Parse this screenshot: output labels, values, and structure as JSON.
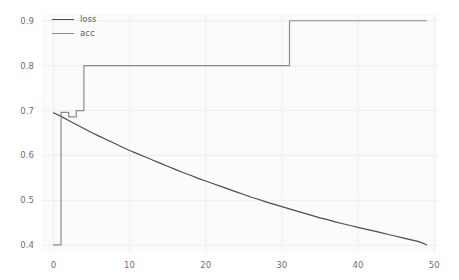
{
  "figure": {
    "width": 459,
    "height": 280,
    "background_color": "#ffffff",
    "axes_background_color": "#fbfbfb",
    "grid_color": "#ededf2"
  },
  "legend": {
    "position": "upper-left",
    "entries": [
      {
        "label": "loss",
        "color": "#4d4d4d",
        "icon": "line-swatch-icon"
      },
      {
        "label": "acc",
        "color": "#8a8a8a",
        "icon": "line-swatch-icon"
      }
    ]
  },
  "axes": {
    "y_ticks": [
      "0.9",
      "0.8",
      "0.7",
      "0.6",
      "0.5",
      "0.4"
    ],
    "x_ticks": [
      "0",
      "10",
      "20",
      "30",
      "40",
      "50"
    ]
  },
  "chart_data": {
    "type": "line",
    "title": "",
    "subtitle": "",
    "xlabel": "",
    "ylabel": "",
    "xlim": [
      -1.5,
      50.5
    ],
    "ylim": [
      0.385,
      0.915
    ],
    "grid": true,
    "legend_position": "upper left",
    "x": [
      0,
      1,
      2,
      3,
      4,
      5,
      6,
      7,
      8,
      9,
      10,
      11,
      12,
      13,
      14,
      15,
      16,
      17,
      18,
      19,
      20,
      21,
      22,
      23,
      24,
      25,
      26,
      27,
      28,
      29,
      30,
      31,
      32,
      33,
      34,
      35,
      36,
      37,
      38,
      39,
      40,
      41,
      42,
      43,
      44,
      45,
      46,
      47,
      48,
      49
    ],
    "series": [
      {
        "name": "loss",
        "color": "#4d4d4d",
        "drawstyle": "default",
        "values": [
          0.695,
          0.687,
          0.678,
          0.669,
          0.66,
          0.651,
          0.643,
          0.635,
          0.627,
          0.619,
          0.611,
          0.604,
          0.597,
          0.59,
          0.583,
          0.576,
          0.569,
          0.562,
          0.556,
          0.549,
          0.543,
          0.537,
          0.531,
          0.525,
          0.519,
          0.513,
          0.507,
          0.502,
          0.496,
          0.491,
          0.486,
          0.481,
          0.476,
          0.471,
          0.466,
          0.461,
          0.457,
          0.452,
          0.448,
          0.444,
          0.44,
          0.436,
          0.432,
          0.428,
          0.424,
          0.42,
          0.416,
          0.412,
          0.408,
          0.401
        ]
      },
      {
        "name": "acc",
        "color": "#8a8a8a",
        "drawstyle": "steps-post",
        "values": [
          0.401,
          0.696,
          0.686,
          0.7,
          0.8,
          0.8,
          0.8,
          0.8,
          0.8,
          0.8,
          0.8,
          0.8,
          0.8,
          0.8,
          0.8,
          0.8,
          0.8,
          0.8,
          0.8,
          0.8,
          0.8,
          0.8,
          0.8,
          0.8,
          0.8,
          0.8,
          0.8,
          0.8,
          0.8,
          0.8,
          0.8,
          0.9,
          0.9,
          0.9,
          0.9,
          0.9,
          0.9,
          0.9,
          0.9,
          0.9,
          0.9,
          0.9,
          0.9,
          0.9,
          0.9,
          0.9,
          0.9,
          0.9,
          0.9,
          0.9
        ]
      }
    ]
  }
}
